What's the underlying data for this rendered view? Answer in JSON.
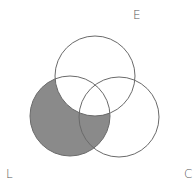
{
  "diagram": {
    "type": "venn",
    "sets": [
      {
        "label": "E",
        "cx": 95,
        "cy": 76,
        "r": 40
      },
      {
        "label": "L",
        "cx": 70,
        "cy": 116,
        "r": 40
      },
      {
        "label": "C",
        "cx": 119,
        "cy": 117,
        "r": 40
      }
    ],
    "shaded_region": "L minus E",
    "colors": {
      "stroke": "#6a6a6a",
      "shade": "#8a8a8a",
      "background": "#ffffff"
    }
  },
  "labels": {
    "e": "E",
    "l": "L",
    "c": "C"
  }
}
